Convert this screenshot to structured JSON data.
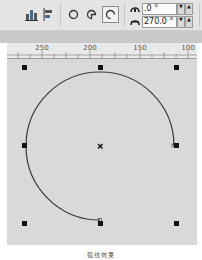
{
  "toolbar": {
    "buttons": [
      {
        "name": "align-to-grid-button",
        "icon": "align-icon"
      },
      {
        "name": "distribute-button",
        "icon": "distribute-icon"
      },
      {
        "name": "ellipse-mode-button",
        "icon": "ellipse-icon"
      },
      {
        "name": "pie-mode-button",
        "icon": "pie-icon"
      },
      {
        "name": "arc-mode-button",
        "icon": "arc-icon",
        "active": true
      }
    ],
    "start_angle": {
      "icon": "start-angle-icon",
      "value": ".0 °",
      "up": "▲",
      "down": "▼"
    },
    "end_angle": {
      "icon": "end-angle-icon",
      "value": "270.0 °",
      "up": "▲",
      "down": "▼"
    }
  },
  "ruler": {
    "labels": [
      {
        "text": "250",
        "x": 42
      },
      {
        "text": "200",
        "x": 90
      },
      {
        "text": "150",
        "x": 140
      },
      {
        "text": "100",
        "x": 188
      }
    ]
  },
  "canvas": {
    "shape": "arc",
    "start_angle_deg": 0,
    "end_angle_deg": 270,
    "center": [
      100,
      146
    ],
    "radius": 74,
    "stroke_color": "#3a3a3a",
    "handle_color": "#111111"
  },
  "caption": "弧线效果"
}
